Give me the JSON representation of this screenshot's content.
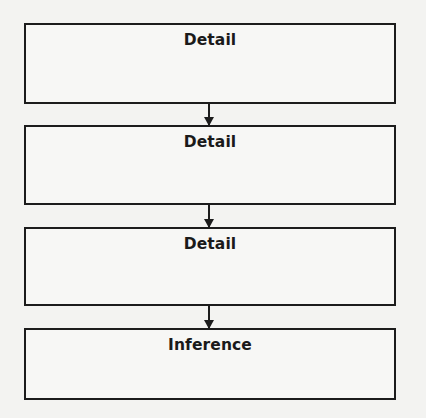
{
  "diagram": {
    "type": "vertical-flowchart",
    "boxes": [
      {
        "label": "Detail"
      },
      {
        "label": "Detail"
      },
      {
        "label": "Detail"
      },
      {
        "label": "Inference"
      }
    ],
    "connections": [
      {
        "from": 0,
        "to": 1
      },
      {
        "from": 1,
        "to": 2
      },
      {
        "from": 2,
        "to": 3
      }
    ],
    "colors": {
      "stroke": "#1c1c1c",
      "background": "#f3f3f1"
    }
  }
}
